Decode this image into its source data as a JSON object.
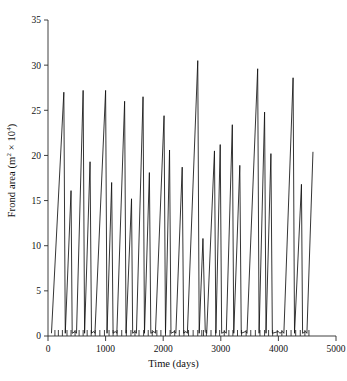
{
  "chart_data": {
    "type": "line",
    "title": "",
    "xlabel": "Time (days)",
    "ylabel": "Frond area (m² × 10⁴)",
    "ylabel_base": "Frond area (m",
    "ylabel_sup1": "2",
    "ylabel_mid": " × 10",
    "ylabel_sup2": "4",
    "ylabel_end": ")",
    "xlim": [
      0,
      5000
    ],
    "ylim": [
      0,
      35
    ],
    "xticks": [
      0,
      1000,
      2000,
      3000,
      4000,
      5000
    ],
    "xticklabels": [
      "0",
      "1000",
      "2000",
      "3000",
      "4000",
      "5000"
    ],
    "yticks": [
      0,
      5,
      10,
      15,
      20,
      25,
      30,
      35
    ],
    "yticklabels": [
      "0",
      "5",
      "10",
      "15",
      "20",
      "25",
      "30",
      "35"
    ],
    "grid": false,
    "legend": false,
    "line_color": "#111111",
    "series": [
      {
        "name": "Frond area",
        "x": [
          60,
          275,
          300,
          400,
          420,
          470,
          495,
          610,
          635,
          730,
          755,
          790,
          815,
          1000,
          1025,
          1105,
          1130,
          1170,
          1195,
          1330,
          1355,
          1450,
          1470,
          1510,
          1535,
          1650,
          1675,
          1760,
          1785,
          1840,
          1865,
          2015,
          2040,
          2110,
          2135,
          2195,
          2220,
          2330,
          2355,
          2395,
          2420,
          2600,
          2625,
          2690,
          2700,
          2730,
          2755,
          2890,
          2915,
          2990,
          3015,
          3070,
          3095,
          3200,
          3225,
          3330,
          3355,
          3430,
          3455,
          3640,
          3665,
          3760,
          3785,
          3870,
          3895,
          4000,
          4025,
          4070,
          4095,
          4255,
          4280,
          4400,
          4420,
          4470,
          4495,
          4600
        ],
        "y": [
          0.3,
          27.0,
          0.3,
          16.1,
          0.3,
          0.5,
          0.3,
          27.2,
          0.3,
          19.3,
          0.3,
          0.5,
          0.3,
          27.2,
          0.3,
          17.0,
          0.3,
          0.5,
          0.3,
          26.0,
          0.3,
          15.2,
          0.3,
          0.5,
          0.3,
          26.5,
          0.3,
          18.1,
          0.3,
          0.5,
          0.3,
          24.4,
          0.3,
          20.6,
          0.3,
          0.5,
          0.3,
          18.7,
          0.3,
          0.5,
          0.3,
          30.5,
          0.3,
          10.8,
          8.3,
          0.5,
          0.3,
          20.5,
          0.3,
          21.2,
          0.3,
          0.5,
          0.3,
          23.4,
          0.3,
          18.9,
          0.3,
          0.5,
          0.3,
          29.6,
          0.3,
          24.8,
          0.3,
          20.2,
          0.3,
          0.5,
          0.3,
          0.5,
          0.3,
          28.6,
          0.3,
          16.8,
          0.3,
          0.5,
          0.3,
          20.4
        ],
        "peaks": [
          {
            "x": 275,
            "y": 27.0
          },
          {
            "x": 400,
            "y": 16.1
          },
          {
            "x": 610,
            "y": 27.2
          },
          {
            "x": 730,
            "y": 19.3
          },
          {
            "x": 1000,
            "y": 27.2
          },
          {
            "x": 1105,
            "y": 17.0
          },
          {
            "x": 1330,
            "y": 26.0
          },
          {
            "x": 1450,
            "y": 15.2
          },
          {
            "x": 1650,
            "y": 26.5
          },
          {
            "x": 1760,
            "y": 18.1
          },
          {
            "x": 2015,
            "y": 24.4
          },
          {
            "x": 2110,
            "y": 20.6
          },
          {
            "x": 2330,
            "y": 18.7
          },
          {
            "x": 2600,
            "y": 30.5
          },
          {
            "x": 2690,
            "y": 10.8
          },
          {
            "x": 2890,
            "y": 20.5
          },
          {
            "x": 2990,
            "y": 21.2
          },
          {
            "x": 3200,
            "y": 23.4
          },
          {
            "x": 3330,
            "y": 18.9
          },
          {
            "x": 3640,
            "y": 29.6
          },
          {
            "x": 3760,
            "y": 24.8
          },
          {
            "x": 3870,
            "y": 20.2
          },
          {
            "x": 4255,
            "y": 28.6
          },
          {
            "x": 4400,
            "y": 16.8
          },
          {
            "x": 4600,
            "y": 20.4
          }
        ],
        "minor_xticks": [
          120,
          180,
          250,
          330,
          400,
          470,
          540,
          610,
          680,
          750,
          820,
          900,
          980,
          1060,
          1130,
          1200,
          1280,
          1360,
          1440,
          1510,
          1580,
          1660,
          1740,
          1810,
          1890,
          1960,
          2040,
          2120,
          2200,
          2280,
          2360,
          2440,
          2520,
          2600,
          2670,
          2700,
          2750,
          2830,
          2910,
          2980,
          3060,
          3140,
          3210,
          3290,
          3360,
          3440,
          3520,
          3600,
          3680,
          3760,
          3830,
          3900,
          3980,
          4060,
          4140,
          4220,
          4300,
          4380,
          4460,
          4530
        ]
      }
    ]
  }
}
